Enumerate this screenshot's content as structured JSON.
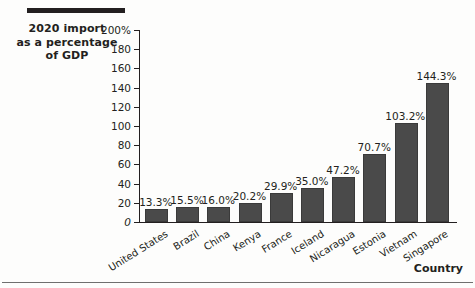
{
  "chart_data": {
    "type": "bar",
    "title": "2020 import as a percentage of GDP",
    "title_lines": [
      "2020 import",
      "as a percentage",
      "of GDP"
    ],
    "xlabel": "Country",
    "ylabel": "",
    "ylim": [
      0,
      200
    ],
    "ytick_labels": [
      "200%",
      "180",
      "160",
      "140",
      "120",
      "100",
      "80",
      "60",
      "40",
      "20",
      "0"
    ],
    "yticks": [
      200,
      180,
      160,
      140,
      120,
      100,
      80,
      60,
      40,
      20,
      0
    ],
    "grid": false,
    "legend": "none",
    "categories": [
      "United States",
      "Brazil",
      "China",
      "Kenya",
      "France",
      "Iceland",
      "Nicaragua",
      "Estonia",
      "Vietnam",
      "Singapore"
    ],
    "values": [
      13.3,
      15.5,
      16.0,
      20.2,
      29.9,
      35.0,
      47.2,
      70.7,
      103.2,
      144.3
    ],
    "value_labels": [
      "13.3%",
      "15.5%",
      "16.0%",
      "20.2%",
      "29.9%",
      "35.0%",
      "47.2%",
      "70.7%",
      "103.2%",
      "144.3%"
    ],
    "bar_color": "#4a4a4a",
    "axis_color": "#231f20",
    "background_color": "#fdfdfc"
  }
}
